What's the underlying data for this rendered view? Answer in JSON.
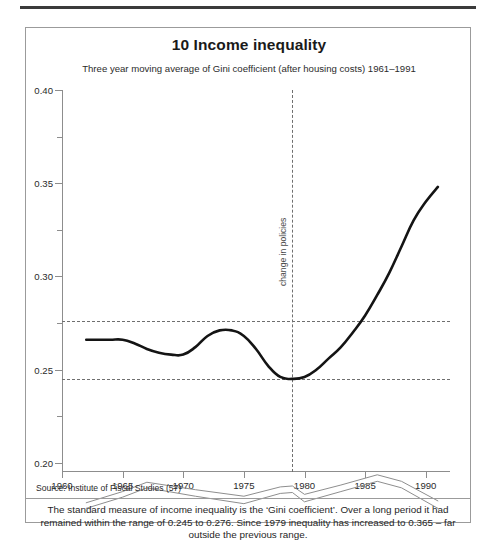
{
  "header": {
    "rule": "top-rule"
  },
  "card": {
    "title": "10 Income inequality",
    "subtitle": "Three year moving average of Gini coefficient (after housing costs) 1961–1991",
    "source": "Source: Institute of Fiscal Studies (57)",
    "caption": "The standard measure of income inequality is the ‘Gini coefficient’. Over a long period it had remained within the range of 0.245 to 0.276. Since 1979 inequality has increased to 0.365 – far outside the previous range."
  },
  "chart_data": {
    "type": "line",
    "title": "10 Income inequality",
    "subtitle": "Three year moving average of Gini coefficient (after housing costs) 1961–1991",
    "xlabel": "",
    "ylabel": "",
    "xlim": [
      1960,
      1992
    ],
    "ylim": [
      0.195,
      0.4
    ],
    "grid": false,
    "legend": "none",
    "y_ticks_major": [
      0.2,
      0.25,
      0.3,
      0.35,
      0.4
    ],
    "y_tick_labels": [
      "0.20",
      "0.25",
      "0.30",
      "0.35",
      "0.40"
    ],
    "y_ticks_minor": [
      0.225,
      0.275,
      0.325,
      0.375
    ],
    "x_ticks": [
      1960,
      1965,
      1970,
      1975,
      1980,
      1985,
      1990
    ],
    "x_tick_labels": [
      "1960",
      "1965",
      "1970",
      "1975",
      "1980",
      "1985",
      "1990"
    ],
    "reference_lines": {
      "horizontal": [
        {
          "value": 0.276,
          "style": "dashed",
          "note": "upper bound of historic range"
        },
        {
          "value": 0.245,
          "style": "dashed",
          "note": "lower bound of historic range"
        }
      ],
      "vertical": [
        {
          "value": 1979,
          "style": "dashed",
          "label": "change in policies"
        }
      ]
    },
    "annotations": [
      {
        "text": "change in policies",
        "x": 1979,
        "rotation": -90
      }
    ],
    "series": [
      {
        "name": "Gini coefficient (after housing costs)",
        "style": "solid-bold-black",
        "color": "#141414",
        "x": [
          1962,
          1963,
          1964,
          1965,
          1966,
          1967,
          1968,
          1969,
          1970,
          1971,
          1972,
          1973,
          1974,
          1975,
          1976,
          1977,
          1978,
          1979,
          1980,
          1981,
          1982,
          1983,
          1984,
          1985,
          1986,
          1987,
          1988,
          1989,
          1990,
          1991
        ],
        "values": [
          0.266,
          0.266,
          0.266,
          0.266,
          0.264,
          0.261,
          0.259,
          0.258,
          0.258,
          0.262,
          0.268,
          0.271,
          0.271,
          0.268,
          0.261,
          0.252,
          0.246,
          0.245,
          0.246,
          0.25,
          0.256,
          0.262,
          0.27,
          0.279,
          0.29,
          0.302,
          0.316,
          0.33,
          0.34,
          0.348
        ]
      },
      {
        "name": "secondary band upper",
        "style": "solid-thin-grey",
        "color": "#8e8e8e",
        "x": [
          1962,
          1965,
          1967,
          1971,
          1975,
          1978,
          1979,
          1980,
          1983,
          1986,
          1988,
          1991
        ],
        "values": [
          0.1785,
          0.1845,
          0.1895,
          0.1855,
          0.182,
          0.187,
          0.1875,
          0.183,
          0.188,
          0.1935,
          0.19,
          0.1795
        ]
      },
      {
        "name": "secondary band lower",
        "style": "solid-thin-grey",
        "color": "#8e8e8e",
        "x": [
          1962,
          1965,
          1967,
          1971,
          1975,
          1978,
          1979,
          1980,
          1983,
          1986,
          1988,
          1991
        ],
        "values": [
          0.1755,
          0.1815,
          0.1865,
          0.182,
          0.178,
          0.1835,
          0.184,
          0.179,
          0.1845,
          0.19,
          0.1865,
          0.1755
        ]
      }
    ]
  }
}
